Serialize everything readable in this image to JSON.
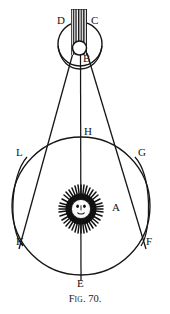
{
  "figure": {
    "caption_prefix": "F",
    "caption_smallcaps": "IG",
    "caption_suffix": ". 70.",
    "caption_full": "Fig. 70.",
    "background_color": "#ffffff",
    "ink_color": "#161616"
  },
  "labels": {
    "D": "D",
    "C": "C",
    "B": "B",
    "H": "H",
    "L": "L",
    "G": "G",
    "A": "A",
    "K": "K",
    "F": "F",
    "E": "E"
  },
  "diagram_data": {
    "type": "geometric-astronomy-diagram",
    "title": "Fig. 70.",
    "description": "Antique astronomical figure: a large orbital circle centred on a sun-face (A) with lettered points E, F, G, H, K, L, and an upper body (B) within a circle bounded by points D and C, with a hatched shadow band and two converging tangent lines.",
    "elements": [
      {
        "name": "orbit-circle",
        "shape": "circle",
        "cx": 81,
        "cy": 206,
        "r": 69,
        "label": "main orbital circle passing through H, G, F, E, K, L"
      },
      {
        "name": "upper-circle",
        "shape": "circle",
        "cx": 80,
        "cy": 44,
        "r": 22,
        "label": "upper circle bounded by D and C"
      },
      {
        "name": "body-circle-B",
        "shape": "circle",
        "cx": 79,
        "cy": 48,
        "r": 7,
        "label": "small circle B"
      },
      {
        "name": "shadow-band",
        "shape": "hatched-rect",
        "x": 71,
        "y": 10,
        "width": 16,
        "height": 44,
        "label": "vertical hatched shadow band between D and C"
      },
      {
        "name": "sun-face",
        "shape": "rayed-disc",
        "cx": 81,
        "cy": 209,
        "r": 22,
        "label": "sun with face and radiating rays, point A"
      },
      {
        "name": "axis-line",
        "shape": "line",
        "x1": 80,
        "y1": 10,
        "x2": 81,
        "y2": 281,
        "label": "vertical axis from shadow band through H, sun, to E"
      },
      {
        "name": "tangent-left",
        "shape": "line",
        "x1": 74,
        "y1": 54,
        "x2": 19,
        "y2": 247,
        "label": "left tangent line through L to K"
      },
      {
        "name": "tangent-right",
        "shape": "line",
        "x1": 86,
        "y1": 54,
        "x2": 145,
        "y2": 247,
        "label": "right tangent line through G to F"
      }
    ],
    "points": [
      {
        "id": "D",
        "x": 64,
        "y": 22,
        "label_x": 59,
        "label_y": 17
      },
      {
        "id": "C",
        "x": 95,
        "y": 22,
        "label_x": 92,
        "label_y": 17
      },
      {
        "id": "B",
        "x": 82,
        "y": 59,
        "label_x": 83,
        "label_y": 56
      },
      {
        "id": "H",
        "x": 81,
        "y": 137,
        "label_x": 84,
        "label_y": 128
      },
      {
        "id": "L",
        "x": 27,
        "y": 157,
        "label_x": 17,
        "label_y": 150
      },
      {
        "id": "G",
        "x": 135,
        "y": 157,
        "label_x": 138,
        "label_y": 150
      },
      {
        "id": "A",
        "x": 108,
        "y": 209,
        "label_x": 112,
        "label_y": 203
      },
      {
        "id": "K",
        "x": 23,
        "y": 245,
        "label_x": 17,
        "label_y": 238
      },
      {
        "id": "F",
        "x": 141,
        "y": 245,
        "label_x": 146,
        "label_y": 238
      },
      {
        "id": "E",
        "x": 81,
        "y": 279,
        "label_x": 78,
        "label_y": 279
      }
    ]
  }
}
